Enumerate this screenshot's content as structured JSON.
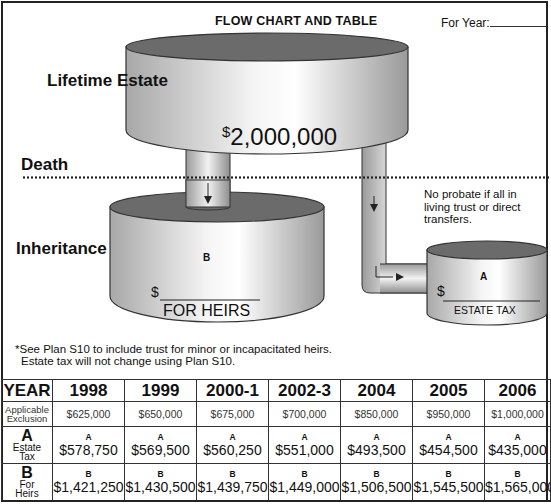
{
  "header": {
    "title": "FLOW CHART AND TABLE",
    "for_year_label": "For Year:"
  },
  "diagram": {
    "labels": {
      "lifetime_estate": "Lifetime Estate",
      "death": "Death",
      "inheritance": "Inheritance"
    },
    "estate_amount_symbol": "$",
    "estate_amount": "2,000,000",
    "probate_note": "No probate if all in living trust or direct transfers.",
    "heirs_tank": {
      "letter": "B",
      "dollar": "$",
      "caption": "FOR HEIRS"
    },
    "tax_tank": {
      "letter": "A",
      "dollar": "$",
      "caption": "ESTATE TAX"
    },
    "footnote_line1": "*See Plan S10 to include trust for minor or incapacitated heirs.",
    "footnote_line2": "Estate tax will not change using Plan S10."
  },
  "table": {
    "year_header": "YEAR",
    "years": [
      "1998",
      "1999",
      "2000-1",
      "2002-3",
      "2004",
      "2005",
      "2006"
    ],
    "exclusion_label_1": "Applicable",
    "exclusion_label_2": "Exclusion",
    "exclusion": [
      "$625,000",
      "$650,000",
      "$675,000",
      "$700,000",
      "$850,000",
      "$950,000",
      "$1,000,000"
    ],
    "tax_letter": "A",
    "tax_label_1": "Estate",
    "tax_label_2": "Tax",
    "estate_tax": [
      "$578,750",
      "$569,500",
      "$560,250",
      "$551,000",
      "$493,500",
      "$454,500",
      "$435,000"
    ],
    "heirs_letter": "B",
    "heirs_label_1": "For",
    "heirs_label_2": "Heirs",
    "for_heirs": [
      "$1,421,250",
      "$1,430,500",
      "$1,439,750",
      "$1,449,000",
      "$1,506,500",
      "$1,545,500",
      "$1,565,000"
    ]
  }
}
